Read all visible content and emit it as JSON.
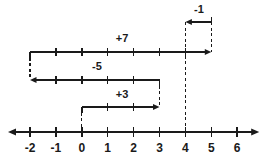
{
  "figure": {
    "kind": "number-line-jump-diagram",
    "width": 263,
    "height": 156,
    "background_color": "#ffffff",
    "stroke_color": "#1a1a1a",
    "text_color": "#1a1a1a"
  },
  "axis": {
    "name": "number-line",
    "min": -2,
    "max": 6,
    "left_arrow": true,
    "right_arrow": true,
    "y": 132,
    "x_at_min": 30,
    "pixels_per_unit": 25.9,
    "tick_labels": [
      "-2",
      "-1",
      "0",
      "1",
      "2",
      "3",
      "4",
      "5",
      "6"
    ],
    "tick_values": [
      -2,
      -1,
      0,
      1,
      2,
      3,
      4,
      5,
      6
    ]
  },
  "jumps": [
    {
      "name": "jump-plus-7",
      "label": "+7",
      "value": 7,
      "from": -2,
      "to": 5,
      "direction": "right",
      "y": 52,
      "label_x": 122,
      "label_y": 38,
      "tick_values": [
        -1,
        0,
        1,
        2,
        3,
        4
      ],
      "riser_from_dashed": false,
      "riser_to_dashed": true
    },
    {
      "name": "jump-minus-1",
      "label": "-1",
      "value": -1,
      "from": 5,
      "to": 4,
      "direction": "left",
      "y": 22,
      "label_x": 199,
      "label_y": 9,
      "tick_values": [],
      "riser_from_dashed": true,
      "riser_to_dashed": false
    },
    {
      "name": "jump-minus-5",
      "label": "-5",
      "value": -5,
      "from": 3,
      "to": -2,
      "direction": "left",
      "y": 80,
      "label_x": 97,
      "label_y": 66,
      "tick_values": [
        -1,
        0,
        1,
        2
      ],
      "riser_from_dashed": false,
      "riser_to_dashed": true
    },
    {
      "name": "jump-plus-3",
      "label": "+3",
      "value": 3,
      "from": 0,
      "to": 3,
      "direction": "right",
      "y": 107,
      "label_x": 122,
      "label_y": 94,
      "tick_values": [
        1,
        2
      ],
      "riser_from_dashed": false,
      "riser_to_dashed": true
    }
  ],
  "connectors": [
    {
      "name": "connector-at-4",
      "at": 4,
      "y_top": 22,
      "y_bottom": 132,
      "dashed": true
    },
    {
      "name": "connector-at-5",
      "at": 5,
      "y_top": 22,
      "y_bottom": 52,
      "dashed": true
    },
    {
      "name": "connector-minus2-plus7-to-minus5",
      "at": -2,
      "y_top": 52,
      "y_bottom": 80,
      "dashed": true
    },
    {
      "name": "connector-at-3-minus5-to-plus3",
      "at": 3,
      "y_top": 80,
      "y_bottom": 107,
      "dashed": true
    },
    {
      "name": "connector-at-0-plus3-to-axis",
      "at": 0,
      "y_top": 107,
      "y_bottom": 132,
      "dashed": true
    }
  ]
}
